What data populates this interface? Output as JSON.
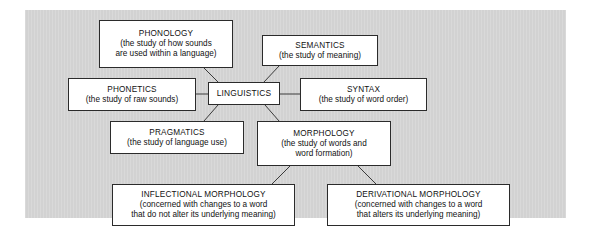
{
  "diagram": {
    "type": "concept-map",
    "background_color": "#d2d2d2",
    "node_fill": "#ffffff",
    "node_border": "#2b2b2b",
    "root": "LINGUISTICS",
    "nodes": [
      {
        "id": "phonology",
        "title": "PHONOLOGY",
        "desc": "(the study of how sounds\nare used within a language)"
      },
      {
        "id": "semantics",
        "title": "SEMANTICS",
        "desc": "(the study of meaning)"
      },
      {
        "id": "phonetics",
        "title": "PHONETICS",
        "desc": "(the study of raw sounds)"
      },
      {
        "id": "linguistics",
        "title": "LINGUISTICS",
        "desc": ""
      },
      {
        "id": "syntax",
        "title": "SYNTAX",
        "desc": "(the study of word order)"
      },
      {
        "id": "pragmatics",
        "title": "PRAGMATICS",
        "desc": "(the study of language use)"
      },
      {
        "id": "morphology",
        "title": "MORPHOLOGY",
        "desc": "(the study of words and\nword formation)"
      },
      {
        "id": "inflectional",
        "title": "INFLECTIONAL MORPHOLOGY",
        "desc": "(concerned with changes to a word\nthat do not alter its underlying meaning)"
      },
      {
        "id": "derivational",
        "title": "DERIVATIONAL MORPHOLOGY",
        "desc": "(concerned with changes to a word\nthat alters its underlying meaning)"
      }
    ],
    "edges": [
      {
        "from": "linguistics",
        "to": "phonology"
      },
      {
        "from": "linguistics",
        "to": "semantics"
      },
      {
        "from": "linguistics",
        "to": "phonetics"
      },
      {
        "from": "linguistics",
        "to": "syntax"
      },
      {
        "from": "linguistics",
        "to": "pragmatics"
      },
      {
        "from": "linguistics",
        "to": "morphology"
      },
      {
        "from": "morphology",
        "to": "inflectional"
      },
      {
        "from": "morphology",
        "to": "derivational"
      }
    ]
  }
}
